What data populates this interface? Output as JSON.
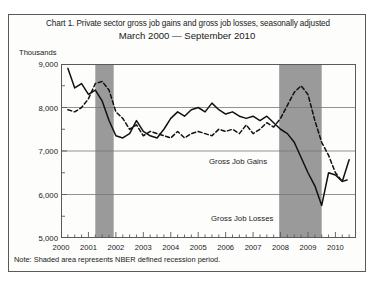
{
  "figure": {
    "title": "Chart 1. Private sector gross job gains and gross job losses, seasonally adjusted",
    "subtitle": "March 2000 — September 2010",
    "y_axis_unit": "Thousands",
    "note": "Note: Shaded area represents NBER defined recession period.",
    "colors": {
      "frame": "#5a5a5a",
      "background": "#fdfdfc",
      "gridline": "#777777",
      "gains_line": "#111111",
      "losses_line": "#111111",
      "recession_shading": "#9a9a9a"
    }
  },
  "chart_data": {
    "type": "line",
    "title": "Chart 1. Private sector gross job gains and gross job losses, seasonally adjusted",
    "subtitle": "March 2000 — September 2010",
    "xlabel": "",
    "ylabel": "Thousands",
    "ylim": [
      5000,
      9000
    ],
    "yticks": [
      5000,
      6000,
      7000,
      8000,
      9000
    ],
    "ytick_labels": [
      "5,000",
      "6,000",
      "7,000",
      "8,000",
      "9,000"
    ],
    "y_minor_tick_interval": 500,
    "xlim": [
      2000.0,
      2010.75
    ],
    "xticks": [
      2000,
      2001,
      2002,
      2003,
      2004,
      2005,
      2006,
      2007,
      2008,
      2009,
      2010
    ],
    "xtick_labels": [
      "2000",
      "2001",
      "2002",
      "2003",
      "2004",
      "2005",
      "2006",
      "2007",
      "2008",
      "2009",
      "2010"
    ],
    "x_minor_tick_interval": 0.25,
    "grid": true,
    "legend": "inline-labels",
    "annotations": [
      {
        "text": "Gross Job Gains",
        "x": 2004.0,
        "y": 8250
      },
      {
        "text": "Gross Job Losses",
        "x": 2004.2,
        "y": 6900
      }
    ],
    "shaded_regions": [
      {
        "label": "NBER recession",
        "x_start": 2001.25,
        "x_end": 2001.92
      },
      {
        "label": "NBER recession",
        "x_start": 2007.95,
        "x_end": 2009.5
      }
    ],
    "series": [
      {
        "name": "Gross Job Gains",
        "style": "solid",
        "x": [
          2000.25,
          2000.5,
          2000.75,
          2001.0,
          2001.25,
          2001.5,
          2001.75,
          2002.0,
          2002.25,
          2002.5,
          2002.75,
          2003.0,
          2003.25,
          2003.5,
          2003.75,
          2004.0,
          2004.25,
          2004.5,
          2004.75,
          2005.0,
          2005.25,
          2005.5,
          2005.75,
          2006.0,
          2006.25,
          2006.5,
          2006.75,
          2007.0,
          2007.25,
          2007.5,
          2007.75,
          2008.0,
          2008.25,
          2008.5,
          2008.75,
          2009.0,
          2009.25,
          2009.5,
          2009.75,
          2010.0,
          2010.25,
          2010.5
        ],
        "values": [
          8900,
          8450,
          8550,
          8300,
          8400,
          8150,
          7700,
          7350,
          7300,
          7400,
          7700,
          7450,
          7350,
          7300,
          7500,
          7750,
          7900,
          7800,
          7950,
          8000,
          7900,
          8100,
          7950,
          7850,
          7900,
          7800,
          7750,
          7800,
          7700,
          7800,
          7650,
          7500,
          7400,
          7200,
          6850,
          6500,
          6200,
          5750,
          6500,
          6450,
          6300,
          6800
        ]
      },
      {
        "name": "Gross Job Losses",
        "style": "dashed",
        "x": [
          2000.25,
          2000.5,
          2000.75,
          2001.0,
          2001.25,
          2001.5,
          2001.75,
          2002.0,
          2002.25,
          2002.5,
          2002.75,
          2003.0,
          2003.25,
          2003.5,
          2003.75,
          2004.0,
          2004.25,
          2004.5,
          2004.75,
          2005.0,
          2005.25,
          2005.5,
          2005.75,
          2006.0,
          2006.25,
          2006.5,
          2006.75,
          2007.0,
          2007.25,
          2007.5,
          2007.75,
          2008.0,
          2008.25,
          2008.5,
          2008.75,
          2009.0,
          2009.25,
          2009.5,
          2009.75,
          2010.0,
          2010.25,
          2010.5
        ],
        "values": [
          7950,
          7900,
          8000,
          8200,
          8550,
          8600,
          8400,
          7900,
          7750,
          7500,
          7600,
          7350,
          7450,
          7400,
          7350,
          7300,
          7450,
          7300,
          7400,
          7450,
          7400,
          7350,
          7500,
          7450,
          7500,
          7400,
          7600,
          7400,
          7500,
          7650,
          7550,
          7750,
          8050,
          8350,
          8500,
          8300,
          7700,
          7200,
          6900,
          6500,
          6300,
          6350
        ]
      }
    ]
  }
}
